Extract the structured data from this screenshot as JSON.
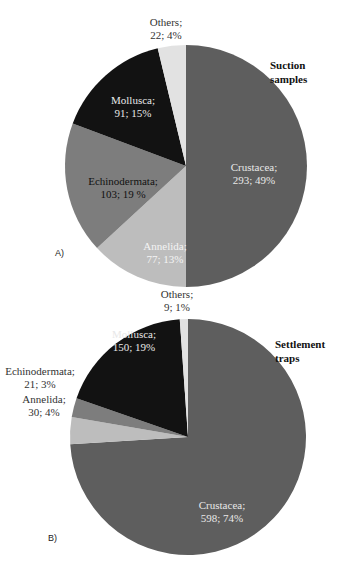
{
  "chart_data": [
    {
      "type": "pie",
      "panel_label": "A)",
      "title": "Suction samples",
      "start_angle_deg": 0,
      "direction": "clockwise",
      "slices": [
        {
          "label": "Crustacea",
          "value": 293,
          "percent": "49%",
          "text": "Crustacea;\n293; 49%",
          "color": "#5e5e5e",
          "text_color": "#e8e8e8"
        },
        {
          "label": "Annelida",
          "value": 77,
          "percent": "13%",
          "text": "Annelida;\n77; 13%",
          "color": "#bdbdbd",
          "text_color": "#f4f4f4"
        },
        {
          "label": "Echinodermata",
          "value": 103,
          "percent": "19 %",
          "text": "Echinodermata;\n103; 19 %",
          "color": "#7d7d7d",
          "text_color": "#111111"
        },
        {
          "label": "Mollusca",
          "value": 91,
          "percent": "15%",
          "text": "Mollusca;\n91; 15%",
          "color": "#121212",
          "text_color": "#e8e8e8"
        },
        {
          "label": "Others",
          "value": 22,
          "percent": "4%",
          "text": "Others;\n22; 4%",
          "color": "#e2e2e2",
          "text_color": "#333333"
        }
      ]
    },
    {
      "type": "pie",
      "panel_label": "B)",
      "title": "Settlement\ntraps",
      "start_angle_deg": 0,
      "direction": "clockwise",
      "slices": [
        {
          "label": "Crustacea",
          "value": 598,
          "percent": "74%",
          "text": "Crustacea;\n598; 74%",
          "color": "#5e5e5e",
          "text_color": "#e8e8e8"
        },
        {
          "label": "Annelida",
          "value": 30,
          "percent": "4%",
          "text": "Annelida;\n30; 4%",
          "color": "#bdbdbd",
          "text_color": "#333333"
        },
        {
          "label": "Echinodermata",
          "value": 21,
          "percent": "3%",
          "text": "Echinodermata;\n21; 3%",
          "color": "#7d7d7d",
          "text_color": "#333333"
        },
        {
          "label": "Mollusca",
          "value": 150,
          "percent": "19%",
          "text": "Mollusca;\n150; 19%",
          "color": "#121212",
          "text_color": "#e8e8e8"
        },
        {
          "label": "Others",
          "value": 9,
          "percent": "1%",
          "text": "Others;\n9; 1%",
          "color": "#e2e2e2",
          "text_color": "#333333"
        }
      ]
    }
  ],
  "layout": {
    "A": {
      "cx": 186,
      "cy": 166,
      "r": 121,
      "label_pos": [
        [
          254,
          174
        ],
        [
          165,
          253
        ],
        [
          123,
          188
        ],
        [
          133,
          107
        ],
        [
          166,
          29
        ]
      ],
      "title_pos": [
        270,
        58
      ],
      "panel_pos": [
        55,
        248
      ]
    },
    "B": {
      "cx": 188,
      "cy": 147,
      "r": 118,
      "label_pos": [
        [
          222,
          222
        ],
        [
          44,
          116
        ],
        [
          40,
          88
        ],
        [
          134,
          51
        ],
        [
          177,
          11
        ]
      ],
      "title_pos": [
        275,
        47
      ],
      "panel_pos": [
        48,
        243
      ]
    }
  }
}
